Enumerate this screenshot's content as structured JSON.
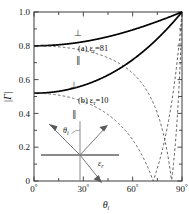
{
  "figure": {
    "background": "#ffffff",
    "frame_color": "#3a3a3a",
    "solid_color": "#000000",
    "dashed_color": "#555555",
    "inset_color": "#777777"
  },
  "axes": {
    "y_title": "|Γ|",
    "x_title": "θ",
    "x_title_sub": "i",
    "y_ticks": [
      "0",
      "0.2",
      "0.4",
      "0.6",
      "0.8",
      "1.0"
    ],
    "x_ticks": [
      "0",
      "30",
      "60",
      "90"
    ],
    "x_tick_suffix": "°",
    "x_minor_ticks": [
      "15",
      "45",
      "75"
    ],
    "y_minor_ticks": [
      "0.1",
      "0.3",
      "0.5",
      "0.7",
      "0.9"
    ]
  },
  "annotations": {
    "label_a": "(a) ε",
    "label_a_sub": "r",
    "label_a_val": "=81",
    "label_b": "(b) ε",
    "label_b_sub": "r",
    "label_b_val": "=10",
    "perp_symbol": "⊥",
    "par_symbol": "∥",
    "perp_a": "⊥",
    "par_a": "∥",
    "perp_b": "⊥",
    "par_b": "∥"
  },
  "inset": {
    "theta_label": "θ",
    "theta_sub": "i",
    "eps_label": "ε",
    "eps_sub": "r",
    "rays": [
      "incident",
      "reflected",
      "transmitted"
    ],
    "interface": "horizontal-boundary",
    "normal": "vertical-normal"
  },
  "chart_data": {
    "type": "line",
    "title": "",
    "xlabel": "θi (degrees)",
    "ylabel": "|Γ|",
    "xlim": [
      0,
      90
    ],
    "ylim": [
      0,
      1
    ],
    "grid": false,
    "legend": "inline-annotations",
    "series": [
      {
        "name": "(a) εr=81, perpendicular",
        "style": "solid",
        "epsilon_r": 81,
        "polarization": "perpendicular",
        "x": [
          0,
          5,
          10,
          15,
          20,
          25,
          30,
          35,
          40,
          45,
          50,
          55,
          60,
          65,
          70,
          75,
          80,
          85,
          88,
          90
        ],
        "values": [
          0.8,
          0.8005,
          0.802,
          0.8046,
          0.8085,
          0.8139,
          0.8211,
          0.8305,
          0.8424,
          0.8573,
          0.8757,
          0.8979,
          0.9239,
          0.9531,
          0.9832,
          1.0,
          1.0,
          1.0,
          1.0,
          1.0
        ]
      },
      {
        "name": "(a) εr=81, parallel",
        "style": "dashed",
        "epsilon_r": 81,
        "polarization": "parallel",
        "x": [
          0,
          10,
          20,
          30,
          40,
          50,
          60,
          65,
          70,
          75,
          80,
          83.66,
          85,
          87,
          88,
          89,
          90
        ],
        "values": [
          0.8,
          0.7976,
          0.7899,
          0.7755,
          0.7513,
          0.7103,
          0.6364,
          0.5767,
          0.4929,
          0.3678,
          0.1686,
          0.0,
          0.0747,
          0.2205,
          0.3176,
          0.4409,
          1.0
        ]
      },
      {
        "name": "(b) εr=10, perpendicular",
        "style": "solid",
        "epsilon_r": 10,
        "polarization": "perpendicular",
        "x": [
          0,
          5,
          10,
          15,
          20,
          25,
          30,
          35,
          40,
          45,
          50,
          55,
          60,
          65,
          70,
          75,
          80,
          85,
          88,
          90
        ],
        "values": [
          0.5195,
          0.5213,
          0.5268,
          0.5362,
          0.5497,
          0.5677,
          0.5908,
          0.6195,
          0.6548,
          0.6977,
          0.7494,
          0.8107,
          0.8818,
          0.9605,
          1.0,
          1.0,
          1.0,
          1.0,
          1.0,
          1.0
        ]
      },
      {
        "name": "(b) εr=10, parallel",
        "style": "dashed",
        "epsilon_r": 10,
        "polarization": "parallel",
        "x": [
          0,
          10,
          20,
          30,
          40,
          50,
          60,
          65,
          70,
          72.45,
          75,
          78,
          81,
          84,
          87,
          89,
          90
        ],
        "values": [
          0.5195,
          0.5082,
          0.4718,
          0.4056,
          0.3005,
          0.1448,
          0.0728,
          0.1492,
          0.0513,
          0.0,
          0.0761,
          0.1873,
          0.3159,
          0.4651,
          0.6407,
          0.7751,
          1.0
        ]
      }
    ],
    "brewster_angles": [
      {
        "epsilon_r": 10,
        "angle_deg": 72.45
      },
      {
        "epsilon_r": 81,
        "angle_deg": 83.66
      }
    ]
  }
}
